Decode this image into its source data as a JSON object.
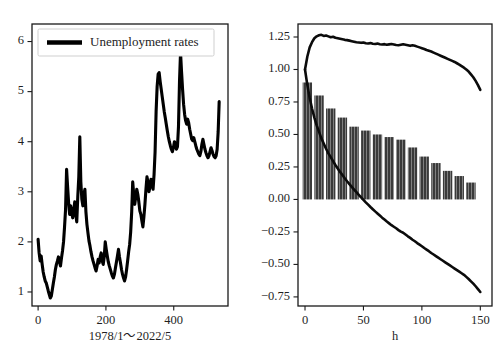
{
  "figure": {
    "background": "#ffffff",
    "line_color": "#000000",
    "bar_color": "#3a3a3a",
    "bar_hatch_color": "#888888",
    "axis_color": "#1a1a1a"
  },
  "chart_data": [
    {
      "id": "left-panel",
      "type": "line",
      "title": "",
      "xlabel": "1978/1～2022/5",
      "ylabel": "",
      "xlim": [
        -18,
        560
      ],
      "ylim": [
        0.72,
        6.35
      ],
      "xticks": [
        0,
        200,
        400
      ],
      "xticklabels": [
        "0",
        "200",
        "400"
      ],
      "yticks": [
        1,
        2,
        3,
        4,
        5,
        6
      ],
      "yticklabels": [
        "1",
        "2",
        "3",
        "4",
        "5",
        "6"
      ],
      "grid": false,
      "legend": {
        "position": "upper-left",
        "entries": [
          "Unemployment rates"
        ]
      },
      "series": [
        {
          "name": "Unemployment rates",
          "color": "#000000",
          "x": [
            0,
            3,
            6,
            9,
            12,
            15,
            18,
            21,
            24,
            27,
            30,
            33,
            36,
            39,
            42,
            45,
            48,
            51,
            54,
            57,
            60,
            63,
            66,
            69,
            72,
            75,
            78,
            81,
            84,
            87,
            90,
            93,
            96,
            99,
            102,
            105,
            108,
            111,
            114,
            117,
            120,
            123,
            126,
            129,
            132,
            135,
            138,
            141,
            144,
            147,
            150,
            153,
            156,
            159,
            162,
            165,
            168,
            171,
            174,
            177,
            180,
            183,
            186,
            189,
            192,
            195,
            198,
            201,
            204,
            207,
            210,
            213,
            216,
            219,
            222,
            225,
            228,
            231,
            234,
            237,
            240,
            243,
            246,
            249,
            252,
            255,
            258,
            261,
            264,
            267,
            270,
            273,
            276,
            279,
            282,
            285,
            288,
            291,
            294,
            297,
            300,
            303,
            306,
            309,
            312,
            315,
            318,
            321,
            324,
            327,
            330,
            333,
            336,
            339,
            342,
            345,
            348,
            351,
            354,
            357,
            360,
            363,
            366,
            369,
            372,
            375,
            378,
            381,
            384,
            387,
            390,
            393,
            396,
            399,
            402,
            405,
            408,
            411,
            414,
            417,
            420,
            423,
            426,
            429,
            432,
            435,
            438,
            441,
            444,
            447,
            450,
            453,
            456,
            459,
            462,
            465,
            468,
            471,
            474,
            477,
            480,
            483,
            486,
            489,
            492,
            495,
            498,
            501,
            504,
            507,
            510,
            513,
            516,
            519,
            522,
            525,
            528,
            531,
            534
          ],
          "y": [
            2.05,
            1.78,
            1.62,
            1.72,
            1.55,
            1.4,
            1.3,
            1.22,
            1.18,
            1.1,
            1.02,
            0.95,
            0.88,
            0.92,
            1.05,
            1.18,
            1.3,
            1.45,
            1.55,
            1.62,
            1.7,
            1.6,
            1.52,
            1.68,
            1.82,
            2.0,
            2.3,
            2.65,
            3.45,
            3.1,
            2.78,
            2.55,
            2.72,
            2.6,
            2.48,
            2.62,
            2.8,
            2.55,
            2.4,
            2.9,
            3.3,
            4.1,
            3.2,
            2.85,
            2.72,
            2.95,
            3.05,
            2.6,
            2.35,
            2.18,
            2.02,
            1.92,
            1.8,
            1.7,
            1.62,
            1.55,
            1.48,
            1.42,
            1.52,
            1.65,
            1.58,
            1.7,
            1.78,
            1.62,
            1.55,
            1.7,
            2.0,
            1.85,
            1.72,
            1.6,
            1.52,
            1.45,
            1.38,
            1.32,
            1.28,
            1.35,
            1.48,
            1.6,
            1.72,
            1.85,
            1.7,
            1.58,
            1.45,
            1.35,
            1.28,
            1.22,
            1.3,
            1.45,
            1.62,
            1.8,
            1.95,
            2.2,
            2.6,
            3.2,
            2.95,
            2.75,
            2.9,
            3.05,
            2.95,
            2.8,
            2.62,
            2.55,
            2.42,
            2.3,
            2.5,
            2.75,
            3.05,
            3.3,
            3.2,
            3.0,
            3.1,
            3.25,
            3.15,
            3.05,
            3.35,
            3.8,
            4.6,
            5.1,
            5.35,
            5.38,
            5.2,
            5.05,
            4.9,
            4.75,
            4.6,
            4.48,
            4.35,
            4.22,
            4.1,
            4.0,
            3.92,
            3.85,
            3.8,
            3.88,
            4.0,
            3.95,
            3.85,
            3.9,
            4.3,
            5.2,
            5.78,
            5.4,
            5.05,
            4.75,
            4.55,
            4.42,
            4.35,
            4.45,
            4.38,
            4.25,
            4.15,
            4.05,
            4.02,
            4.08,
            4.0,
            3.92,
            3.85,
            3.8,
            3.75,
            3.72,
            3.8,
            3.95,
            4.05,
            3.95,
            3.85,
            3.78,
            3.72,
            3.68,
            3.72,
            3.8,
            3.88,
            3.82,
            3.75,
            3.7,
            3.68,
            3.72,
            3.85,
            4.2,
            4.8,
            4.05,
            3.78,
            3.7,
            3.65,
            3.72
          ]
        }
      ]
    },
    {
      "id": "right-panel",
      "type": "bar+line",
      "title": "",
      "xlabel": "h",
      "ylabel": "",
      "xlim": [
        -6,
        160
      ],
      "ylim": [
        -0.82,
        1.35
      ],
      "xticks": [
        0,
        50,
        100,
        150
      ],
      "xticklabels": [
        "0",
        "50",
        "100",
        "150"
      ],
      "yticks": [
        1.25,
        1.0,
        0.75,
        0.5,
        0.25,
        0.0,
        -0.25,
        -0.5,
        -0.75
      ],
      "yticklabels": [
        "1.25",
        "1.00",
        "0.75",
        "0.50",
        "0.25",
        "0.00",
        "−0.25",
        "−0.50",
        "−0.75"
      ],
      "grid": false,
      "legend": null,
      "bars": {
        "name": "confidence band width",
        "color": "#3a3a3a",
        "width": 8,
        "x": [
          2,
          12,
          22,
          32,
          42,
          52,
          62,
          72,
          82,
          92,
          102,
          112,
          122,
          132,
          142
        ],
        "values": [
          0.9,
          0.8,
          0.7,
          0.63,
          0.56,
          0.53,
          0.5,
          0.48,
          0.46,
          0.4,
          0.33,
          0.28,
          0.22,
          0.18,
          0.13
        ]
      },
      "series": [
        {
          "name": "upper bound",
          "color": "#000000",
          "x": [
            0,
            2,
            4,
            6,
            8,
            10,
            12,
            14,
            16,
            18,
            20,
            22,
            24,
            26,
            28,
            30,
            32,
            34,
            36,
            38,
            40,
            42,
            44,
            46,
            48,
            50,
            52,
            54,
            56,
            58,
            60,
            62,
            64,
            66,
            68,
            70,
            72,
            74,
            76,
            78,
            80,
            82,
            84,
            86,
            88,
            90,
            92,
            94,
            96,
            98,
            100,
            102,
            104,
            106,
            108,
            110,
            112,
            114,
            116,
            118,
            120,
            122,
            124,
            126,
            128,
            130,
            132,
            134,
            136,
            138,
            140,
            142,
            144,
            146,
            148,
            150
          ],
          "y": [
            1.0,
            1.1,
            1.17,
            1.21,
            1.24,
            1.255,
            1.263,
            1.267,
            1.258,
            1.262,
            1.255,
            1.248,
            1.252,
            1.244,
            1.24,
            1.236,
            1.232,
            1.228,
            1.226,
            1.222,
            1.218,
            1.214,
            1.21,
            1.208,
            1.205,
            1.208,
            1.202,
            1.2,
            1.203,
            1.198,
            1.196,
            1.199,
            1.194,
            1.192,
            1.195,
            1.19,
            1.193,
            1.196,
            1.192,
            1.188,
            1.186,
            1.19,
            1.194,
            1.19,
            1.186,
            1.182,
            1.186,
            1.182,
            1.176,
            1.17,
            1.164,
            1.158,
            1.15,
            1.144,
            1.138,
            1.13,
            1.122,
            1.114,
            1.106,
            1.098,
            1.09,
            1.082,
            1.074,
            1.066,
            1.058,
            1.048,
            1.038,
            1.026,
            1.014,
            1.0,
            0.984,
            0.962,
            0.94,
            0.912,
            0.88,
            0.843
          ]
        },
        {
          "name": "lower bound",
          "color": "#000000",
          "x": [
            0,
            2,
            4,
            6,
            8,
            10,
            12,
            14,
            16,
            18,
            20,
            22,
            24,
            26,
            28,
            30,
            32,
            34,
            36,
            38,
            40,
            42,
            44,
            46,
            48,
            50,
            52,
            54,
            56,
            58,
            60,
            62,
            64,
            66,
            68,
            70,
            72,
            74,
            76,
            78,
            80,
            82,
            84,
            86,
            88,
            90,
            92,
            94,
            96,
            98,
            100,
            102,
            104,
            106,
            108,
            110,
            112,
            114,
            116,
            118,
            120,
            122,
            124,
            126,
            128,
            130,
            132,
            134,
            136,
            138,
            140,
            142,
            144,
            146,
            148,
            150
          ],
          "y": [
            1.0,
            0.88,
            0.78,
            0.7,
            0.63,
            0.57,
            0.52,
            0.47,
            0.43,
            0.39,
            0.355,
            0.325,
            0.295,
            0.265,
            0.238,
            0.212,
            0.188,
            0.163,
            0.14,
            0.118,
            0.097,
            0.076,
            0.056,
            0.036,
            0.016,
            -0.003,
            -0.022,
            -0.04,
            -0.058,
            -0.075,
            -0.092,
            -0.108,
            -0.124,
            -0.14,
            -0.155,
            -0.17,
            -0.184,
            -0.198,
            -0.21,
            -0.222,
            -0.236,
            -0.248,
            -0.256,
            -0.27,
            -0.284,
            -0.296,
            -0.31,
            -0.322,
            -0.336,
            -0.348,
            -0.36,
            -0.374,
            -0.386,
            -0.398,
            -0.412,
            -0.424,
            -0.436,
            -0.448,
            -0.46,
            -0.472,
            -0.484,
            -0.496,
            -0.508,
            -0.52,
            -0.532,
            -0.544,
            -0.556,
            -0.568,
            -0.58,
            -0.596,
            -0.612,
            -0.63,
            -0.648,
            -0.668,
            -0.69,
            -0.712
          ]
        }
      ]
    }
  ]
}
